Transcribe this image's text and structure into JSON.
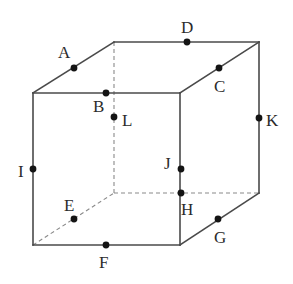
{
  "figure": {
    "name": "labeled-cube-diagram",
    "type": "geometry-diagram",
    "shape": "cube",
    "background_color": "#ffffff",
    "solid_edge_color": "#4a4a4a",
    "hidden_edge_color": "#8a8a8a",
    "dot_color": "#141414",
    "label_color": "#2b2b2b",
    "width": 293,
    "height": 284
  },
  "geometry": {
    "vertices": {
      "front_top_left": [
        33,
        93
      ],
      "front_top_right": [
        180,
        93
      ],
      "front_bottom_left": [
        33,
        245
      ],
      "front_bottom_right": [
        180,
        245
      ],
      "back_top_left": [
        114,
        42
      ],
      "back_top_right": [
        259,
        42
      ],
      "back_bottom_left": [
        114,
        193
      ],
      "back_bottom_right": [
        259,
        193
      ]
    },
    "solid_edges": [
      [
        33,
        93,
        180,
        93
      ],
      [
        33,
        93,
        33,
        245
      ],
      [
        180,
        93,
        180,
        245
      ],
      [
        33,
        245,
        180,
        245
      ],
      [
        33,
        93,
        114,
        42
      ],
      [
        180,
        93,
        259,
        42
      ],
      [
        114,
        42,
        259,
        42
      ],
      [
        259,
        42,
        259,
        193
      ],
      [
        180,
        245,
        259,
        193
      ]
    ],
    "dashed_edges": [
      [
        114,
        42,
        114,
        193
      ],
      [
        114,
        193,
        259,
        193
      ],
      [
        33,
        245,
        114,
        193
      ]
    ]
  },
  "points": [
    {
      "id": "A",
      "label": "A",
      "dot": [
        74,
        68
      ],
      "label_pos": [
        58,
        58
      ],
      "on_edge": "front-top-left-to-back-top-left"
    },
    {
      "id": "B",
      "label": "B",
      "dot": [
        106,
        93
      ],
      "label_pos": [
        93,
        112
      ],
      "on_edge": "front-top-edge"
    },
    {
      "id": "C",
      "label": "C",
      "dot": [
        219,
        68
      ],
      "label_pos": [
        214,
        92
      ],
      "on_edge": "front-top-right-to-back-top-right"
    },
    {
      "id": "D",
      "label": "D",
      "dot": [
        187,
        42
      ],
      "label_pos": [
        181,
        33
      ],
      "on_edge": "back-top-edge"
    },
    {
      "id": "E",
      "label": "E",
      "dot": [
        74,
        219
      ],
      "label_pos": [
        64,
        211
      ],
      "on_edge": "front-bottom-left-to-back-bottom-left"
    },
    {
      "id": "F",
      "label": "F",
      "dot": [
        106,
        245
      ],
      "label_pos": [
        99,
        268
      ],
      "on_edge": "front-bottom-edge"
    },
    {
      "id": "G",
      "label": "G",
      "dot": [
        218,
        219
      ],
      "label_pos": [
        214,
        243
      ],
      "on_edge": "front-bottom-right-to-back-bottom-right"
    },
    {
      "id": "H",
      "label": "H",
      "dot": [
        181,
        193
      ],
      "label_pos": [
        181,
        215
      ],
      "on_edge": "front-right-vertical-edge"
    },
    {
      "id": "I",
      "label": "I",
      "dot": [
        33,
        169
      ],
      "label_pos": [
        18,
        177
      ],
      "on_edge": "front-left-vertical-edge"
    },
    {
      "id": "J",
      "label": "J",
      "dot": [
        181,
        169
      ],
      "label_pos": [
        164,
        169
      ],
      "on_edge": "front-right-vertical-edge"
    },
    {
      "id": "K",
      "label": "K",
      "dot": [
        259,
        118
      ],
      "label_pos": [
        266,
        126
      ],
      "on_edge": "back-right-vertical-edge"
    },
    {
      "id": "L",
      "label": "L",
      "dot": [
        114,
        117
      ],
      "label_pos": [
        122,
        126
      ],
      "on_edge": "back-left-vertical-hidden-edge"
    }
  ]
}
